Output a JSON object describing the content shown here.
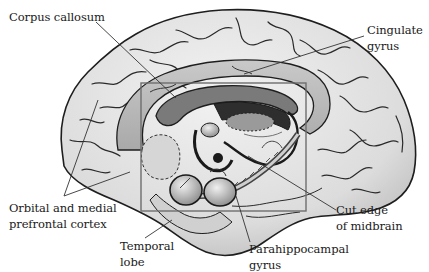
{
  "figure": {
    "highlight_box": {
      "x": 141,
      "y": 83,
      "width": 165,
      "height": 128,
      "stroke": "#6e6e6e"
    },
    "colors": {
      "cortex_fill": "#e4e4e4",
      "cortex_shade": "#c8c8c8",
      "cingulate_fill": "#bdbdbd",
      "corpus_callosum_fill": "#7a7a7a",
      "deep_structure_dark": "#2a2a2a",
      "outline": "#1e1e1e",
      "label_text": "#1a1a1a",
      "leader_line": "#333333"
    }
  },
  "labels": [
    {
      "id": "corpus-callosum",
      "lines": [
        "Corpus callosum"
      ]
    },
    {
      "id": "cingulate-gyrus",
      "lines": [
        "Cingulate",
        "gyrus"
      ]
    },
    {
      "id": "orbital-medial-prefrontal-cortex",
      "lines": [
        "Orbital and medial",
        "prefrontal cortex"
      ]
    },
    {
      "id": "temporal-lobe",
      "lines": [
        "Temporal",
        "lobe"
      ]
    },
    {
      "id": "cut-edge-midbrain",
      "lines": [
        "Cut edge",
        "of midbrain"
      ]
    },
    {
      "id": "parahippocampal-gyrus",
      "lines": [
        "Parahippocampal",
        "gyrus"
      ]
    }
  ]
}
